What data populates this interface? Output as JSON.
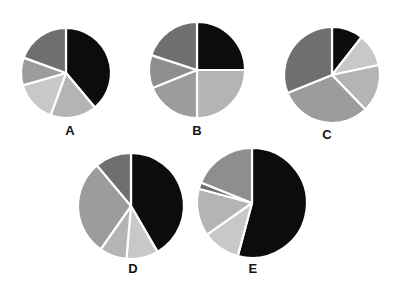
{
  "figure": {
    "background_color": "#ffffff",
    "width": 396,
    "height": 287,
    "label_color": "#141414"
  },
  "palette": {
    "black": "#0c0c0c",
    "dark_gray": "#6f6f6f",
    "medium_gray": "#8e8e8e",
    "gray": "#9c9c9c",
    "light_gray": "#b4b4b4",
    "lighter_gray": "#c8c8c8",
    "separator": "#ffffff"
  },
  "chart_data": [
    {
      "type": "pie",
      "title": "A",
      "cx": 66,
      "cy": 73,
      "r": 45,
      "start_angle": 0,
      "direction": "clockwise",
      "labels": [
        "Slice 1",
        "Slice 2",
        "Slice 3",
        "Slice 4",
        "Slice 5"
      ],
      "values": [
        39,
        17,
        15,
        10,
        19
      ],
      "angles_deg": [
        140,
        60,
        54,
        36,
        70
      ],
      "colors": [
        "#0c0c0c",
        "#b4b4b4",
        "#c8c8c8",
        "#9c9c9c",
        "#6f6f6f"
      ],
      "xlabel": "",
      "ylabel": "",
      "legend": false,
      "grid": false
    },
    {
      "type": "pie",
      "title": "B",
      "cx": 197,
      "cy": 70,
      "r": 48,
      "start_angle": 0,
      "direction": "clockwise",
      "labels": [
        "Slice 1",
        "Slice 2",
        "Slice 3",
        "Slice 4",
        "Slice 5"
      ],
      "values": [
        25,
        25,
        19,
        11,
        20
      ],
      "angles_deg": [
        90,
        90,
        68,
        40,
        72
      ],
      "colors": [
        "#0c0c0c",
        "#b4b4b4",
        "#9c9c9c",
        "#8e8e8e",
        "#6f6f6f"
      ],
      "xlabel": "",
      "ylabel": "",
      "legend": false,
      "grid": false
    },
    {
      "type": "pie",
      "title": "C",
      "cx": 332,
      "cy": 75,
      "r": 48,
      "start_angle": 0,
      "direction": "clockwise",
      "labels": [
        "Slice 1",
        "Slice 2",
        "Slice 3",
        "Slice 4",
        "Slice 5"
      ],
      "values": [
        11,
        11,
        16,
        31,
        31
      ],
      "angles_deg": [
        38,
        40,
        58,
        112,
        112
      ],
      "colors": [
        "#0c0c0c",
        "#c8c8c8",
        "#b4b4b4",
        "#9c9c9c",
        "#6f6f6f"
      ],
      "xlabel": "",
      "ylabel": "",
      "legend": false,
      "grid": false
    },
    {
      "type": "pie",
      "title": "D",
      "cx": 131,
      "cy": 206,
      "r": 53,
      "start_angle": 0,
      "direction": "clockwise",
      "labels": [
        "Slice 1",
        "Slice 2",
        "Slice 3",
        "Slice 4",
        "Slice 5"
      ],
      "values": [
        42,
        10,
        8,
        29,
        11
      ],
      "angles_deg": [
        150,
        35,
        30,
        105,
        40
      ],
      "colors": [
        "#0c0c0c",
        "#c8c8c8",
        "#b4b4b4",
        "#9c9c9c",
        "#6f6f6f"
      ],
      "xlabel": "",
      "ylabel": "",
      "legend": false,
      "grid": false
    },
    {
      "type": "pie",
      "title": "E",
      "cx": 252,
      "cy": 203,
      "r": 55,
      "start_angle": 0,
      "direction": "clockwise",
      "labels": [
        "Slice 1",
        "Slice 2",
        "Slice 3",
        "Slice 4",
        "Slice 5"
      ],
      "values": [
        54,
        11,
        14,
        2,
        19
      ],
      "angles_deg": [
        195,
        40,
        50,
        7,
        68
      ],
      "colors": [
        "#0c0c0c",
        "#c8c8c8",
        "#b4b4b4",
        "#6f6f6f",
        "#8e8e8e"
      ],
      "xlabel": "",
      "ylabel": "",
      "legend": false,
      "grid": false
    }
  ],
  "charts": [
    {
      "id": "a",
      "label": "A",
      "label_x": 70,
      "label_y": 124
    },
    {
      "id": "b",
      "label": "B",
      "label_x": 197,
      "label_y": 124
    },
    {
      "id": "c",
      "label": "C",
      "label_x": 327,
      "label_y": 128
    },
    {
      "id": "d",
      "label": "D",
      "label_x": 133,
      "label_y": 262
    },
    {
      "id": "e",
      "label": "E",
      "label_x": 253,
      "label_y": 262
    }
  ]
}
